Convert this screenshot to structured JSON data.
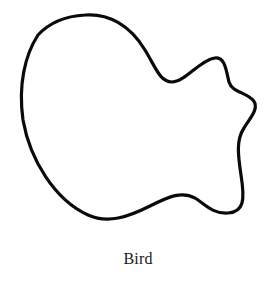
{
  "figure": {
    "caption": "Bird",
    "stroke_color": "#0a0a0a",
    "background_color": "#ffffff",
    "shape": "closed-blob-contour"
  }
}
